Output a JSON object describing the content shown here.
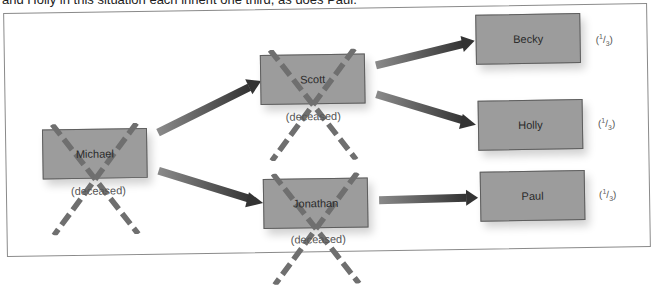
{
  "caption": "and Holly in this situation each inherit one third, as does Paul.",
  "nodes": {
    "michael": {
      "label": "Michael",
      "status": "(deceased)"
    },
    "scott": {
      "label": "Scott",
      "status": "(deceased)"
    },
    "jonathan": {
      "label": "Jonathan",
      "status": "(deceased)"
    },
    "becky": {
      "label": "Becky",
      "share_open": "(",
      "share_num": "1",
      "share_den": "3",
      "share_close": ")"
    },
    "holly": {
      "label": "Holly",
      "share_open": "(",
      "share_num": "1",
      "share_den": "3",
      "share_close": ")"
    },
    "paul": {
      "label": "Paul",
      "share_open": "(",
      "share_num": "1",
      "share_den": "3",
      "share_close": ")"
    }
  },
  "edges": [
    {
      "from": "Michael",
      "to": "Scott"
    },
    {
      "from": "Michael",
      "to": "Jonathan"
    },
    {
      "from": "Scott",
      "to": "Becky"
    },
    {
      "from": "Scott",
      "to": "Holly"
    },
    {
      "from": "Jonathan",
      "to": "Paul"
    }
  ],
  "colors": {
    "box_fill": "#9c9c9c",
    "box_border": "#5e5e5e",
    "cross": "#6f6f6f",
    "arrow_dark": "#3a3a3a",
    "arrow_light": "#8a8a8a",
    "frame": "#8a8a8a"
  }
}
